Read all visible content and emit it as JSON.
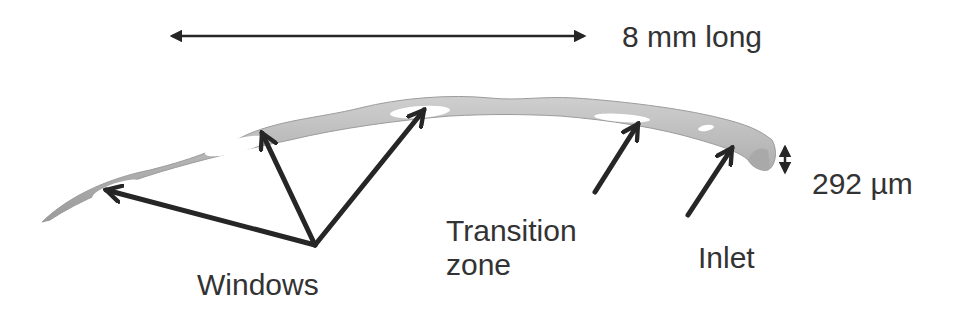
{
  "figure": {
    "colors": {
      "stent_body": "#b8b8b8",
      "stent_shadow": "#8f8f8f",
      "windows": "#ffffff",
      "arrows": "#262626",
      "text": "#333333"
    }
  },
  "dimensions": {
    "length_label": "8 mm long",
    "width_label": "292 µm"
  },
  "annotations": {
    "windows": "Windows",
    "transition_line1": "Transition",
    "transition_line2": "zone",
    "inlet": "Inlet"
  }
}
